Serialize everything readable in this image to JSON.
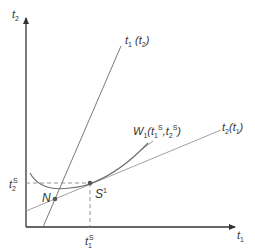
{
  "diagram": {
    "type": "reaction-function diagram",
    "colors": {
      "axis": "#333333",
      "line": "#7a7a7a",
      "curve": "#6e6e6e",
      "dashed": "#888888",
      "point": "#555555",
      "text": "#333333"
    },
    "axes": {
      "y": {
        "var": "t",
        "sub": "2"
      },
      "x": {
        "var": "t",
        "sub": "1"
      }
    },
    "curves": {
      "reaction_1": {
        "var": "t",
        "sub": "1",
        "arg_var": "t",
        "arg_sub": "2",
        "label": "t1(t2)"
      },
      "reaction_2": {
        "var": "t",
        "sub": "2",
        "arg_var": "t",
        "arg_sub": "1",
        "label": "t2(t1)"
      },
      "welfare": {
        "var": "W",
        "sub": "1",
        "label": "W1(t1S, t2S)"
      }
    },
    "points": {
      "nash": {
        "label": "N"
      },
      "stackelberg": {
        "label": "S",
        "sup": "1"
      }
    },
    "ticks": {
      "t2S": {
        "var": "t",
        "sub": "2",
        "sup": "S"
      },
      "t1S": {
        "var": "t",
        "sub": "1",
        "sup": "S"
      }
    }
  }
}
